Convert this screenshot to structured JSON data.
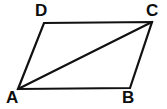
{
  "figure": {
    "kind": "geometry-diagram",
    "background_color": "#ffffff",
    "stroke_color": "#111111",
    "stroke_width": 2.2,
    "canvas": {
      "width": 167,
      "height": 109
    },
    "vertices": [
      {
        "id": "A",
        "label": "A",
        "x": 18,
        "y": 89
      },
      {
        "id": "B",
        "label": "B",
        "x": 130,
        "y": 88
      },
      {
        "id": "C",
        "label": "C",
        "x": 152,
        "y": 22
      },
      {
        "id": "D",
        "label": "D",
        "x": 44,
        "y": 23
      }
    ],
    "edges": [
      {
        "id": "AB",
        "from": "A",
        "to": "B",
        "name": "side-ab"
      },
      {
        "id": "BC",
        "from": "B",
        "to": "C",
        "name": "side-bc"
      },
      {
        "id": "CD",
        "from": "C",
        "to": "D",
        "name": "side-cd"
      },
      {
        "id": "DA",
        "from": "D",
        "to": "A",
        "name": "side-da"
      },
      {
        "id": "AC",
        "from": "A",
        "to": "C",
        "name": "diagonal-ac"
      }
    ],
    "outline_points": "18,89 44,23 152,22 130,88",
    "diagonal_points": "18,89 152,22",
    "labels": {
      "A": "A",
      "B": "B",
      "C": "C",
      "D": "D"
    }
  }
}
